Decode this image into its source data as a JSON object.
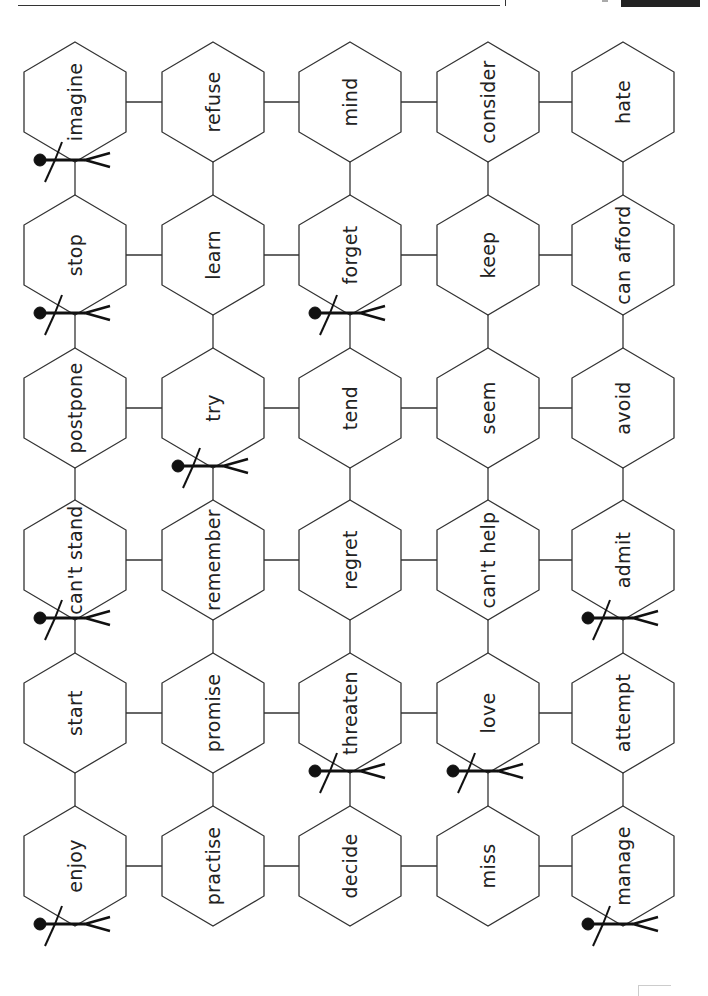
{
  "board": {
    "columns": 5,
    "rows": 6,
    "orientation": "rotated-90",
    "cells": [
      [
        "imagine",
        "refuse",
        "mind",
        "consider",
        "hate"
      ],
      [
        "stop",
        "learn",
        "forget",
        "keep",
        "can afford"
      ],
      [
        "postpone",
        "try",
        "tend",
        "seem",
        "avoid"
      ],
      [
        "can't stand",
        "remember",
        "regret",
        "can't help",
        "admit"
      ],
      [
        "start",
        "promise",
        "threaten",
        "love",
        "attempt"
      ],
      [
        "enjoy",
        "practise",
        "decide",
        "miss",
        "manage"
      ]
    ],
    "illustrations": [
      {
        "cell": "imagine",
        "icon": "stick-figure-lightbulb-icon"
      },
      {
        "cell": "stop",
        "icon": "stick-figure-stop-icon"
      },
      {
        "cell": "forget",
        "icon": "stick-figure-forget-icon"
      },
      {
        "cell": "try",
        "icon": "stick-figure-weightlifting-icon"
      },
      {
        "cell": "can't stand",
        "icon": "stick-figure-angry-icon"
      },
      {
        "cell": "admit",
        "icon": "stick-figure-kneeling-icon"
      },
      {
        "cell": "threaten",
        "icon": "stick-figure-bow-arrow-icon"
      },
      {
        "cell": "love",
        "icon": "stick-figure-flower-icon"
      },
      {
        "cell": "enjoy",
        "icon": "stick-figure-dancing-icon"
      },
      {
        "cell": "manage",
        "icon": "stick-figure-weightlifting-icon"
      }
    ],
    "colors": {
      "line": "#333333",
      "text": "#222222",
      "ink": "#111111",
      "background": "#ffffff"
    }
  }
}
